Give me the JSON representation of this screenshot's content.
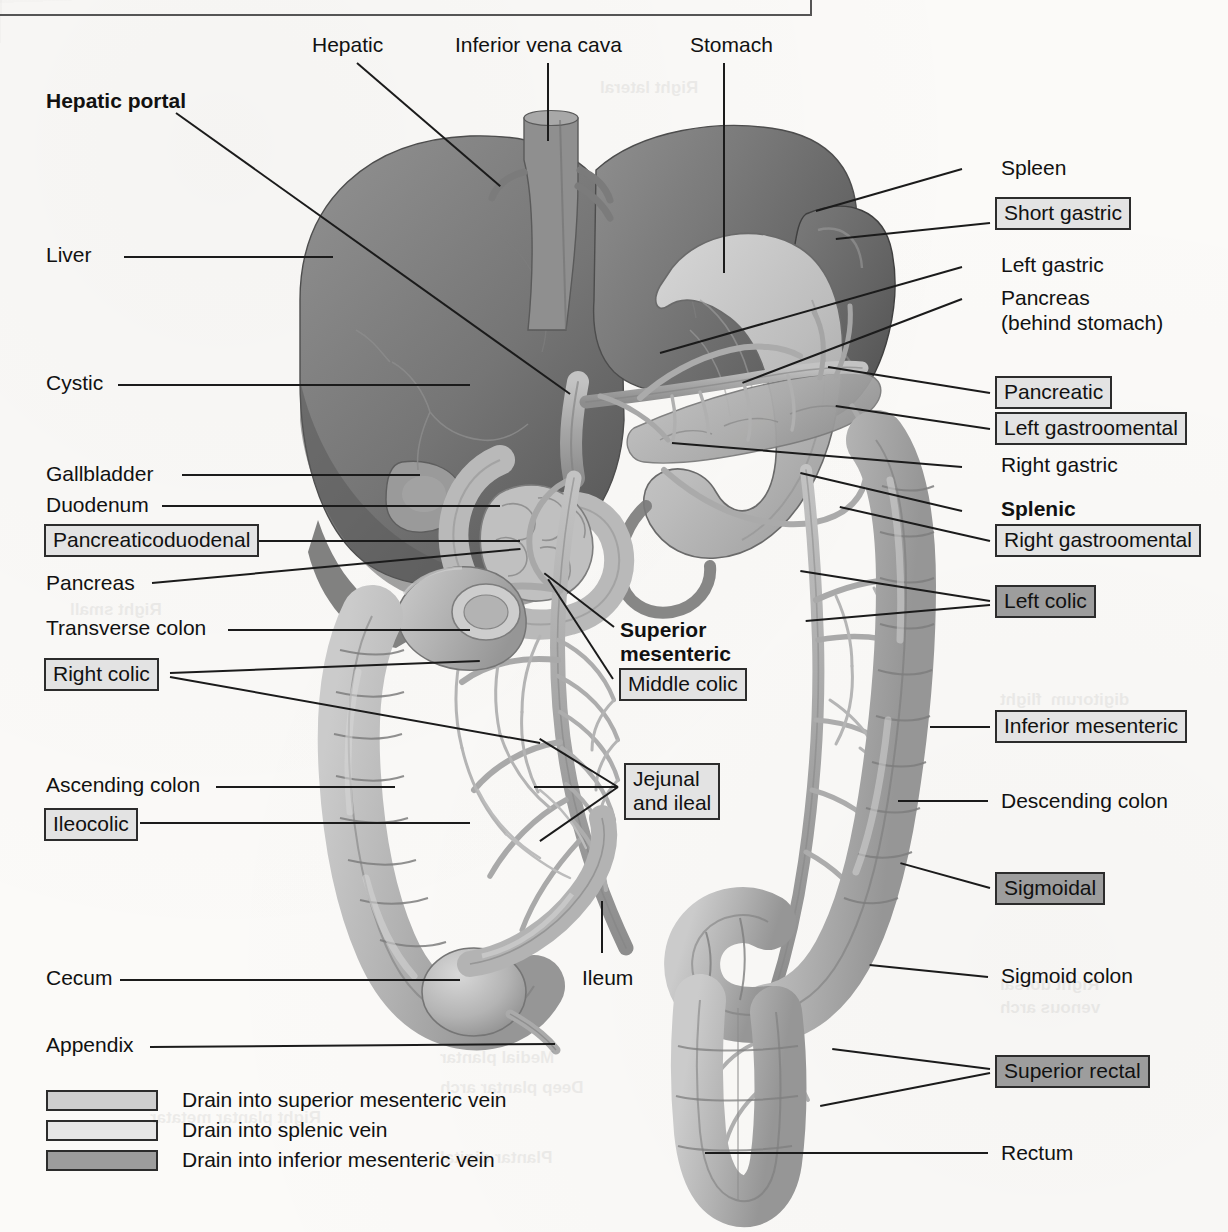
{
  "figure": {
    "top_rule": true
  },
  "labels_plain": [
    {
      "name": "hepatic",
      "text": "Hepatic",
      "x": 312,
      "y": 32,
      "bold": false
    },
    {
      "name": "inferior-vena-cava",
      "text": "Inferior vena cava",
      "x": 455,
      "y": 32,
      "bold": false
    },
    {
      "name": "stomach",
      "text": "Stomach",
      "x": 690,
      "y": 32,
      "bold": false
    },
    {
      "name": "hepatic-portal",
      "text": "Hepatic portal",
      "x": 46,
      "y": 88,
      "bold": true
    },
    {
      "name": "liver",
      "text": "Liver",
      "x": 46,
      "y": 242,
      "bold": false
    },
    {
      "name": "cystic",
      "text": "Cystic",
      "x": 46,
      "y": 370,
      "bold": false
    },
    {
      "name": "gallbladder",
      "text": "Gallbladder",
      "x": 46,
      "y": 461,
      "bold": false
    },
    {
      "name": "duodenum",
      "text": "Duodenum",
      "x": 46,
      "y": 492,
      "bold": false
    },
    {
      "name": "pancreas-left",
      "text": "Pancreas",
      "x": 46,
      "y": 570,
      "bold": false
    },
    {
      "name": "transverse-colon",
      "text": "Transverse colon",
      "x": 46,
      "y": 615,
      "bold": false
    },
    {
      "name": "ascending-colon",
      "text": "Ascending colon",
      "x": 46,
      "y": 772,
      "bold": false
    },
    {
      "name": "cecum",
      "text": "Cecum",
      "x": 46,
      "y": 965,
      "bold": false
    },
    {
      "name": "appendix",
      "text": "Appendix",
      "x": 46,
      "y": 1032,
      "bold": false
    },
    {
      "name": "spleen",
      "text": "Spleen",
      "x": 1001,
      "y": 155,
      "bold": false
    },
    {
      "name": "left-gastric",
      "text": "Left gastric",
      "x": 1001,
      "y": 252,
      "bold": false
    },
    {
      "name": "pancreas-right",
      "text": "Pancreas",
      "x": 1001,
      "y": 285,
      "bold": false
    },
    {
      "name": "pancreas-right-2",
      "text": "(behind stomach)",
      "x": 1001,
      "y": 310,
      "bold": false
    },
    {
      "name": "right-gastric",
      "text": "Right gastric",
      "x": 1001,
      "y": 452,
      "bold": false
    },
    {
      "name": "splenic",
      "text": "Splenic",
      "x": 1001,
      "y": 496,
      "bold": true
    },
    {
      "name": "descending-colon",
      "text": "Descending colon",
      "x": 1001,
      "y": 788,
      "bold": false
    },
    {
      "name": "sigmoid-colon",
      "text": "Sigmoid colon",
      "x": 1001,
      "y": 963,
      "bold": false
    },
    {
      "name": "rectum",
      "text": "Rectum",
      "x": 1001,
      "y": 1140,
      "bold": false
    },
    {
      "name": "superior-mesenteric",
      "text": "Superior",
      "x": 620,
      "y": 617,
      "bold": true
    },
    {
      "name": "superior-mesenteric-2",
      "text": "mesenteric",
      "x": 620,
      "y": 641,
      "bold": true
    },
    {
      "name": "ileum",
      "text": "Ileum",
      "x": 582,
      "y": 965,
      "bold": false
    }
  ],
  "labels_boxed": [
    {
      "name": "short-gastric",
      "text": "Short gastric",
      "x": 995,
      "y": 197,
      "shade": "light"
    },
    {
      "name": "pancreatic",
      "text": "Pancreatic",
      "x": 995,
      "y": 376,
      "shade": "light"
    },
    {
      "name": "left-gastroomental",
      "text": "Left gastroomental",
      "x": 995,
      "y": 412,
      "shade": "light"
    },
    {
      "name": "right-gastroomental",
      "text": "Right gastroomental",
      "x": 995,
      "y": 524,
      "shade": "light"
    },
    {
      "name": "left-colic",
      "text": "Left colic",
      "x": 995,
      "y": 585,
      "shade": "dark"
    },
    {
      "name": "inferior-mesenteric",
      "text": "Inferior mesenteric",
      "x": 995,
      "y": 710,
      "shade": "light"
    },
    {
      "name": "sigmoidal",
      "text": "Sigmoidal",
      "x": 995,
      "y": 872,
      "shade": "dark"
    },
    {
      "name": "superior-rectal",
      "text": "Superior rectal",
      "x": 995,
      "y": 1055,
      "shade": "dark"
    },
    {
      "name": "pancreaticoduodenal",
      "text": "Pancreaticoduodenal",
      "x": 44,
      "y": 524,
      "shade": "light"
    },
    {
      "name": "right-colic",
      "text": "Right colic",
      "x": 44,
      "y": 658,
      "shade": "light"
    },
    {
      "name": "ileocolic",
      "text": "Ileocolic",
      "x": 44,
      "y": 808,
      "shade": "light"
    },
    {
      "name": "middle-colic",
      "text": "Middle colic",
      "x": 619,
      "y": 668,
      "shade": "light"
    },
    {
      "name": "jejunal-and-ileal",
      "text": "Jejunal\nand ileal",
      "x": 624,
      "y": 763,
      "shade": "light"
    }
  ],
  "leaders": [
    {
      "name": "leader-hepatic",
      "x1": 357,
      "y1": 62,
      "x2": 500,
      "y2": 185
    },
    {
      "name": "leader-inferior-vena-cava",
      "x1": 548,
      "y1": 62,
      "x2": 548,
      "y2": 140
    },
    {
      "name": "leader-stomach",
      "x1": 724,
      "y1": 62,
      "x2": 724,
      "y2": 272
    },
    {
      "name": "leader-hepatic-portal",
      "x1": 176,
      "y1": 112,
      "x2": 570,
      "y2": 393
    },
    {
      "name": "leader-liver",
      "x1": 124,
      "y1": 256,
      "x2": 333,
      "y2": 256
    },
    {
      "name": "leader-cystic",
      "x1": 118,
      "y1": 384,
      "x2": 470,
      "y2": 384
    },
    {
      "name": "leader-gallbladder",
      "x1": 182,
      "y1": 474,
      "x2": 420,
      "y2": 474
    },
    {
      "name": "leader-duodenum",
      "x1": 162,
      "y1": 505,
      "x2": 500,
      "y2": 505
    },
    {
      "name": "leader-pancreaticoduodenal",
      "x1": 258,
      "y1": 540,
      "x2": 520,
      "y2": 540
    },
    {
      "name": "leader-pancreas-left",
      "x1": 152,
      "y1": 582,
      "x2": 520,
      "y2": 548
    },
    {
      "name": "leader-transverse-colon",
      "x1": 228,
      "y1": 629,
      "x2": 470,
      "y2": 629
    },
    {
      "name": "leader-right-colic-a",
      "x1": 170,
      "y1": 672,
      "x2": 480,
      "y2": 660
    },
    {
      "name": "leader-right-colic-b",
      "x1": 170,
      "y1": 676,
      "x2": 540,
      "y2": 742
    },
    {
      "name": "leader-ascending-colon",
      "x1": 216,
      "y1": 786,
      "x2": 395,
      "y2": 786
    },
    {
      "name": "leader-ileocolic",
      "x1": 140,
      "y1": 822,
      "x2": 470,
      "y2": 822
    },
    {
      "name": "leader-cecum",
      "x1": 120,
      "y1": 979,
      "x2": 460,
      "y2": 979
    },
    {
      "name": "leader-appendix",
      "x1": 150,
      "y1": 1046,
      "x2": 555,
      "y2": 1043
    },
    {
      "name": "leader-spleen",
      "x1": 962,
      "y1": 168,
      "x2": 816,
      "y2": 210
    },
    {
      "name": "leader-short-gastric",
      "x1": 990,
      "y1": 222,
      "x2": 836,
      "y2": 238
    },
    {
      "name": "leader-left-gastric",
      "x1": 962,
      "y1": 266,
      "x2": 660,
      "y2": 352
    },
    {
      "name": "leader-pancreas-right",
      "x1": 962,
      "y1": 298,
      "x2": 742,
      "y2": 382
    },
    {
      "name": "leader-pancreatic",
      "x1": 990,
      "y1": 392,
      "x2": 828,
      "y2": 366
    },
    {
      "name": "leader-left-gastroomental",
      "x1": 990,
      "y1": 428,
      "x2": 836,
      "y2": 405
    },
    {
      "name": "leader-right-gastric",
      "x1": 962,
      "y1": 466,
      "x2": 672,
      "y2": 442
    },
    {
      "name": "leader-splenic",
      "x1": 962,
      "y1": 510,
      "x2": 800,
      "y2": 472
    },
    {
      "name": "leader-right-gastroomental",
      "x1": 990,
      "y1": 540,
      "x2": 840,
      "y2": 506
    },
    {
      "name": "leader-left-colic-a",
      "x1": 990,
      "y1": 600,
      "x2": 800,
      "y2": 570
    },
    {
      "name": "leader-left-colic-b",
      "x1": 990,
      "y1": 604,
      "x2": 806,
      "y2": 620
    },
    {
      "name": "leader-inferior-mesenteric",
      "x1": 990,
      "y1": 726,
      "x2": 930,
      "y2": 726
    },
    {
      "name": "leader-descending-colon",
      "x1": 988,
      "y1": 800,
      "x2": 898,
      "y2": 800
    },
    {
      "name": "leader-sigmoidal",
      "x1": 990,
      "y1": 887,
      "x2": 900,
      "y2": 862
    },
    {
      "name": "leader-sigmoid-colon",
      "x1": 988,
      "y1": 976,
      "x2": 870,
      "y2": 964
    },
    {
      "name": "leader-superior-rectal-a",
      "x1": 990,
      "y1": 1068,
      "x2": 832,
      "y2": 1048
    },
    {
      "name": "leader-superior-rectal-b",
      "x1": 990,
      "y1": 1072,
      "x2": 820,
      "y2": 1105
    },
    {
      "name": "leader-rectum",
      "x1": 988,
      "y1": 1152,
      "x2": 705,
      "y2": 1152
    },
    {
      "name": "leader-superior-mesenteric",
      "x1": 614,
      "y1": 626,
      "x2": 544,
      "y2": 572
    },
    {
      "name": "leader-middle-colic",
      "x1": 613,
      "y1": 678,
      "x2": 548,
      "y2": 578
    },
    {
      "name": "leader-jejunal-a",
      "x1": 618,
      "y1": 786,
      "x2": 534,
      "y2": 786
    },
    {
      "name": "leader-jejunal-b",
      "x1": 618,
      "y1": 786,
      "x2": 540,
      "y2": 738
    },
    {
      "name": "leader-jejunal-c",
      "x1": 618,
      "y1": 786,
      "x2": 540,
      "y2": 840
    },
    {
      "name": "leader-ileum",
      "x1": 602,
      "y1": 900,
      "x2": 602,
      "y2": 952
    }
  ],
  "legend": {
    "rows": [
      {
        "name": "legend-superior-mesenteric",
        "text": "Drain into superior mesenteric vein",
        "color": "#cfcfcf"
      },
      {
        "name": "legend-splenic",
        "text": "Drain into splenic vein",
        "color": "#e6e6e6"
      },
      {
        "name": "legend-inferior-mesenteric",
        "text": "Drain into inferior mesenteric vein",
        "color": "#9d9d9d"
      }
    ]
  },
  "palette": {
    "liver_dark": "#6f6f6f",
    "liver_mid": "#8a8a8a",
    "stomach": "#bdbdbd",
    "colon": "#b6b6b6",
    "vessel": "#a9a9a9",
    "outline": "#6a6a6a",
    "label_text": "#111111",
    "box_border": "#2c2c2c"
  },
  "bleed_text": [
    {
      "text": "Right lateral",
      "x": 600,
      "y": 78
    },
    {
      "text": "Right small",
      "x": 70,
      "y": 600
    },
    {
      "text": "digitorum  flight",
      "x": 1000,
      "y": 690
    },
    {
      "text": "Right dorsal",
      "x": 1000,
      "y": 975
    },
    {
      "text": "venous arch",
      "x": 1000,
      "y": 998
    },
    {
      "text": "Right plantar metatar",
      "x": 150,
      "y": 1108
    },
    {
      "text": "Medial plantar",
      "x": 440,
      "y": 1048
    },
    {
      "text": "Deep plantar arch",
      "x": 440,
      "y": 1078
    },
    {
      "text": "Plantar digital",
      "x": 440,
      "y": 1148
    }
  ]
}
